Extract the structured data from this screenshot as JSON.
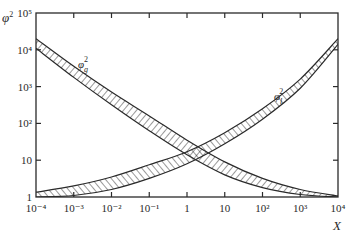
{
  "chart_data": {
    "type": "line",
    "title": "",
    "xlabel": "X",
    "ylabel": "φ²",
    "xscale": "log",
    "yscale": "log",
    "xlim": [
      0.0001,
      10000
    ],
    "ylim": [
      1,
      100000
    ],
    "grid": false,
    "legend": "inline labels on curves",
    "x_ticks": [
      "10⁻⁴",
      "10⁻³",
      "10⁻²",
      "10⁻¹",
      "1",
      "10",
      "10²",
      "10³",
      "10⁴"
    ],
    "y_ticks": [
      "1",
      "10",
      "10²",
      "10³",
      "10⁴",
      "10⁵"
    ],
    "x": [
      0.0001,
      0.001,
      0.01,
      0.1,
      1,
      10,
      100,
      1000,
      10000
    ],
    "series": [
      {
        "name": "φg²",
        "label": "φ",
        "label_sub": "g",
        "style": "hatched band",
        "upper": [
          20000,
          3550,
          710,
          160,
          35,
          9,
          3.2,
          1.6,
          1.07
        ],
        "lower": [
          11000,
          1780,
          320,
          63,
          14,
          4,
          1.8,
          1.17,
          1.0
        ]
      },
      {
        "name": "φl²",
        "label": "φ",
        "label_sub": "l",
        "style": "hatched band",
        "upper": [
          1.35,
          2.0,
          3.5,
          7.5,
          17,
          56,
          250,
          1600,
          20000
        ],
        "lower": [
          1.0,
          1.1,
          1.6,
          3.2,
          8,
          28,
          130,
          900,
          14000
        ]
      }
    ]
  },
  "labels": {
    "y_axis": "φ",
    "y_axis_sup": "2",
    "x_axis": "X",
    "series_g": "φ",
    "series_g_sub": "g",
    "series_g_sup": "2",
    "series_l": "φ",
    "series_l_sub": "l",
    "series_l_sup": "2"
  }
}
